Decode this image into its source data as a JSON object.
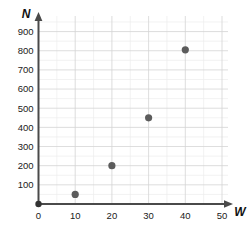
{
  "chart_data": {
    "type": "scatter",
    "title": "",
    "xlabel": "W",
    "ylabel": "N",
    "xlim": [
      0,
      50
    ],
    "ylim": [
      0,
      950
    ],
    "grid": true,
    "legend": false,
    "x_ticks": [
      "0",
      "10",
      "20",
      "30",
      "40",
      "50"
    ],
    "x_tick_values": [
      0,
      10,
      20,
      30,
      40,
      50
    ],
    "y_ticks": [
      "100",
      "200",
      "300",
      "400",
      "500",
      "600",
      "700",
      "800",
      "900"
    ],
    "y_tick_values": [
      100,
      200,
      300,
      400,
      500,
      600,
      700,
      800,
      900
    ],
    "x": [
      10,
      20,
      30,
      40
    ],
    "values": [
      50,
      200,
      450,
      805
    ],
    "points": [
      {
        "x": 10,
        "y": 50
      },
      {
        "x": 20,
        "y": 200
      },
      {
        "x": 30,
        "y": 450
      },
      {
        "x": 40,
        "y": 805
      }
    ],
    "origin_marker": {
      "x": 0,
      "y": 0
    },
    "marker_color": "#5c5c5c",
    "axis_color": "#4a4a4a",
    "grid_major_color": "#d4d4d4",
    "grid_minor_color": "#ececec"
  },
  "axes": {
    "y_axis_label": "N",
    "x_axis_label": "W"
  }
}
